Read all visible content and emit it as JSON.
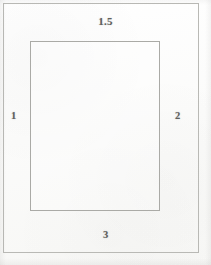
{
  "diagram": {
    "type": "page-margin-diagram",
    "page_outline": {
      "name": "page-boundary-rectangle"
    },
    "text_block_outline": {
      "name": "text-block-rectangle"
    },
    "margins": {
      "top_label": "1.5",
      "left_label": "1",
      "right_label": "2",
      "bottom_label": "3"
    },
    "colors": {
      "paper": "#fdfdfc",
      "outer_line": "#b9b9b5",
      "inner_line": "#aaaaa6",
      "label_text": "#4a4a48"
    }
  }
}
